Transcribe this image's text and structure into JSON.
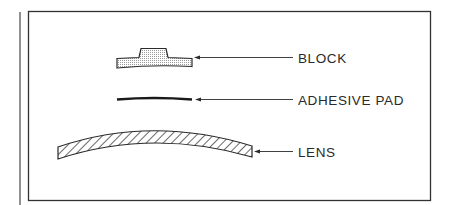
{
  "diagram": {
    "title": "",
    "components": [
      {
        "id": "block",
        "label": "BLOCK",
        "fill": "dotted-gray"
      },
      {
        "id": "adhesive_pad",
        "label": "ADHESIVE PAD",
        "fill": "solid-black"
      },
      {
        "id": "lens",
        "label": "LENS",
        "fill": "hatched"
      }
    ]
  },
  "colors": {
    "stroke": "#2a2a2a",
    "block_fill": "#d4d4d4",
    "background": "#ffffff"
  }
}
